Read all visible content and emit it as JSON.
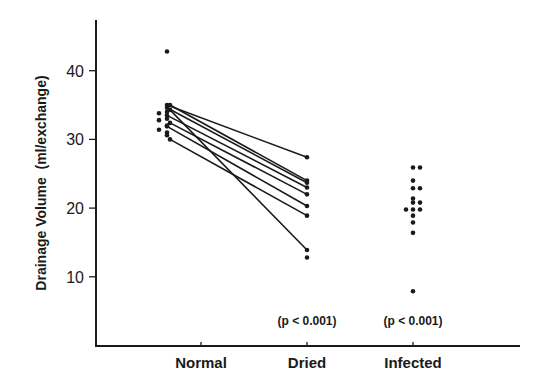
{
  "chart_data": {
    "type": "scatter",
    "title": "",
    "xlabel": "",
    "ylabel": "Drainage Volume  (ml/exchange)",
    "categories": [
      "Normal",
      "Dried",
      "Infected"
    ],
    "ylim": [
      0,
      47
    ],
    "yticks": [
      10,
      20,
      30,
      40
    ],
    "grid": false,
    "legend": "none",
    "paired_series": {
      "name": "Normal vs Dried (paired)",
      "pairs": [
        {
          "normal": 35.0,
          "dried": 27.4
        },
        {
          "normal": 35.0,
          "dried": 24.0
        },
        {
          "normal": 34.6,
          "dried": 23.7
        },
        {
          "normal": 34.3,
          "dried": 13.9
        },
        {
          "normal": 33.5,
          "dried": 23.0
        },
        {
          "normal": 32.4,
          "dried": 22.0
        },
        {
          "normal": 31.9,
          "dried": 20.3
        },
        {
          "normal": 30.0,
          "dried": 18.9
        }
      ]
    },
    "unpaired_points": [
      {
        "category": "Normal",
        "values": [
          42.8,
          33.8,
          32.8,
          31.4,
          34.0,
          33.0,
          32.0,
          31.0,
          30.6
        ]
      },
      {
        "category": "Dried",
        "values": [
          12.8
        ]
      },
      {
        "category": "Infected",
        "values": [
          25.9,
          25.9,
          24.0,
          22.9,
          22.9,
          21.4,
          20.8,
          20.8,
          19.8,
          19.8,
          19.8,
          18.9,
          17.9,
          16.4,
          7.9
        ]
      }
    ],
    "annotations": [
      {
        "category": "Dried",
        "text": "(p < 0.001)"
      },
      {
        "category": "Infected",
        "text": "(p < 0.001)"
      }
    ]
  }
}
